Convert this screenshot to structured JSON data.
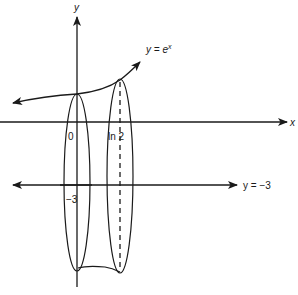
{
  "diagram": {
    "axes": {
      "x_label": "x",
      "y_label": "y"
    },
    "curve": {
      "label_prefix": "y = e",
      "label_exponent": "x"
    },
    "line": {
      "label": "y = −3"
    },
    "ticks": {
      "origin": "0",
      "ln2": "ln 2",
      "neg3": "−3"
    },
    "colors": {
      "stroke": "#1a1a1a",
      "background": "#ffffff"
    }
  }
}
